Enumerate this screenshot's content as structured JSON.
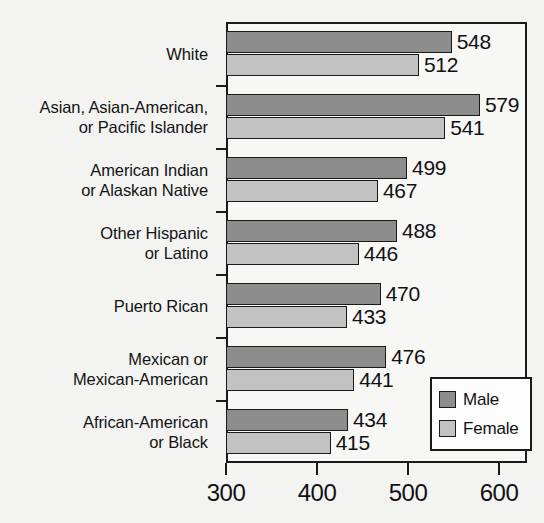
{
  "chart_data": {
    "type": "bar",
    "orientation": "horizontal",
    "title": "",
    "subtitle": "",
    "xlabel": "",
    "ylabel": "",
    "xlim": [
      300,
      630
    ],
    "xticks": [
      300,
      400,
      500,
      600
    ],
    "xtick_labels": [
      "300",
      "400",
      "500",
      "600"
    ],
    "grid": false,
    "legend_position": "bottom-right",
    "categories": [
      "White",
      "Asian, Asian-American, or Pacific Islander",
      "American Indian or Alaskan Native",
      "Other Hispanic or Latino",
      "Puerto Rican",
      "Mexican or Mexican-American",
      "African-American or Black"
    ],
    "series": [
      {
        "name": "Male",
        "color": "#8d8d8d",
        "values": [
          548,
          579,
          499,
          488,
          470,
          476,
          434
        ]
      },
      {
        "name": "Female",
        "color": "#c2c2c2",
        "values": [
          512,
          541,
          467,
          446,
          433,
          441,
          415
        ]
      }
    ]
  },
  "categories": [
    {
      "lines": [
        "White"
      ],
      "male": "548",
      "female": "512"
    },
    {
      "lines": [
        "Asian, Asian-American,",
        "or Pacific Islander"
      ],
      "male": "579",
      "female": "541"
    },
    {
      "lines": [
        "American Indian",
        "or Alaskan Native"
      ],
      "male": "499",
      "female": "467"
    },
    {
      "lines": [
        "Other Hispanic",
        "or Latino"
      ],
      "male": "488",
      "female": "446"
    },
    {
      "lines": [
        "Puerto Rican"
      ],
      "male": "470",
      "female": "433"
    },
    {
      "lines": [
        "Mexican or",
        "Mexican-American"
      ],
      "male": "476",
      "female": "441"
    },
    {
      "lines": [
        "African-American",
        "or Black"
      ],
      "male": "434",
      "female": "415"
    }
  ],
  "axis": {
    "ticks": [
      {
        "label": "300",
        "value": 300
      },
      {
        "label": "400",
        "value": 400
      },
      {
        "label": "500",
        "value": 500
      },
      {
        "label": "600",
        "value": 600
      }
    ]
  },
  "legend": {
    "items": [
      {
        "label": "Male",
        "color": "#8d8d8d"
      },
      {
        "label": "Female",
        "color": "#c2c2c2"
      }
    ]
  },
  "colors": {
    "male_bar": "#8d8d8d",
    "female_bar": "#c2c2c2",
    "outline": "#1a1a1a",
    "background": "#f3f3f2",
    "plot_background": "#f7f7f6"
  }
}
